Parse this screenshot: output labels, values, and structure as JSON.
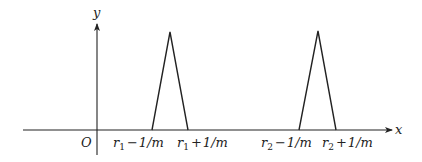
{
  "diagram": {
    "type": "function-plot",
    "axes": {
      "x_label": "x",
      "y_label": "y",
      "origin_label": "O"
    },
    "peaks": [
      {
        "name": "peak-r1",
        "center": "r1",
        "left_label": {
          "var": "r",
          "sub": "1",
          "op": "−",
          "rest": "1/m"
        },
        "right_label": {
          "var": "r",
          "sub": "1",
          "op": "+",
          "rest": "1/m"
        }
      },
      {
        "name": "peak-r2",
        "center": "r2",
        "left_label": {
          "var": "r",
          "sub": "2",
          "op": "−",
          "rest": "1/m"
        },
        "right_label": {
          "var": "r",
          "sub": "2",
          "op": "+",
          "rest": "1/m"
        }
      }
    ],
    "colors": {
      "line": "#222222",
      "background": "#ffffff"
    }
  }
}
